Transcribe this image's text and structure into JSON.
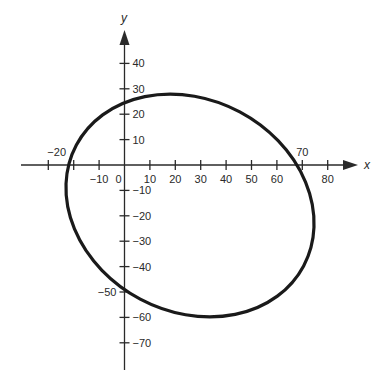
{
  "chart_data": {
    "type": "line",
    "title": "",
    "xlabel": "x",
    "ylabel": "y",
    "x_ticks": [
      -30,
      -20,
      -10,
      0,
      10,
      20,
      30,
      40,
      50,
      60,
      70,
      80
    ],
    "x_tick_labels": [
      {
        "value": -20,
        "text": "−20",
        "position": "above"
      },
      {
        "value": -10,
        "text": "−10",
        "position": "below"
      },
      {
        "value": 0,
        "text": "0",
        "position": "below"
      },
      {
        "value": 10,
        "text": "10",
        "position": "below"
      },
      {
        "value": 20,
        "text": "20",
        "position": "below"
      },
      {
        "value": 30,
        "text": "30",
        "position": "below"
      },
      {
        "value": 40,
        "text": "40",
        "position": "below"
      },
      {
        "value": 50,
        "text": "50",
        "position": "below"
      },
      {
        "value": 60,
        "text": "60",
        "position": "below"
      },
      {
        "value": 70,
        "text": "70",
        "position": "above"
      },
      {
        "value": 80,
        "text": "80",
        "position": "below"
      }
    ],
    "y_ticks": [
      40,
      30,
      20,
      10,
      -10,
      -20,
      -30,
      -40,
      -50,
      -60,
      -70
    ],
    "y_tick_labels": [
      {
        "value": 40,
        "text": "40",
        "position": "right"
      },
      {
        "value": 30,
        "text": "30",
        "position": "right"
      },
      {
        "value": 20,
        "text": "20",
        "position": "right"
      },
      {
        "value": 10,
        "text": "10",
        "position": "right"
      },
      {
        "value": -10,
        "text": "−10",
        "position": "right"
      },
      {
        "value": -20,
        "text": "−20",
        "position": "right"
      },
      {
        "value": -30,
        "text": "−30",
        "position": "right"
      },
      {
        "value": -40,
        "text": "−40",
        "position": "right"
      },
      {
        "value": -50,
        "text": "−50",
        "position": "left"
      },
      {
        "value": -60,
        "text": "−60",
        "position": "right"
      },
      {
        "value": -70,
        "text": "−70",
        "position": "right"
      }
    ],
    "xlim": [
      -40,
      95
    ],
    "ylim": [
      -80,
      55
    ],
    "grid": false,
    "series": [
      {
        "name": "ellipse",
        "center": [
          26,
          -16
        ],
        "semi_major": 51,
        "semi_minor": 42,
        "rotation_deg": -28,
        "x_intercepts": [
          -17,
          67
        ],
        "y_intercepts": [
          25,
          -50
        ],
        "approx_extremes": {
          "top": [
            18,
            28
          ],
          "bottom": [
            35,
            -60
          ],
          "left": [
            -23,
            -15
          ],
          "right": [
            75,
            -27
          ]
        },
        "color": "#1a1a1a"
      }
    ]
  }
}
